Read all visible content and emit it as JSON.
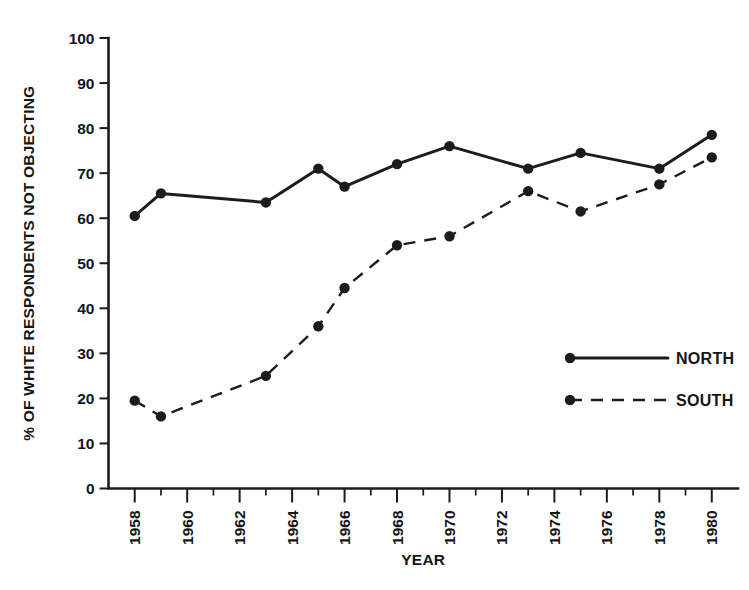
{
  "chart_data": {
    "type": "line",
    "title": "",
    "xlabel": "YEAR",
    "ylabel": "% OF WHITE RESPONDENTS NOT OBJECTING",
    "xlim": [
      1957,
      1981
    ],
    "ylim": [
      0,
      100
    ],
    "grid": false,
    "legend_position": "center-right",
    "y_ticks": [
      0,
      10,
      20,
      30,
      40,
      50,
      60,
      70,
      80,
      90,
      100
    ],
    "y_tick_labels": [
      "0",
      "10",
      "20",
      "30",
      "40",
      "50",
      "60",
      "70",
      "80",
      "90",
      "100"
    ],
    "x_ticks": [
      1958,
      1960,
      1962,
      1964,
      1966,
      1968,
      1970,
      1972,
      1974,
      1976,
      1978,
      1980
    ],
    "x_tick_labels": [
      "1958",
      "1960",
      "1962",
      "1964",
      "1966",
      "1968",
      "1970",
      "1972",
      "1974",
      "1976",
      "1978",
      "1980"
    ],
    "x_minor_ticks": [
      1959,
      1961,
      1963,
      1965,
      1967,
      1969,
      1971,
      1973,
      1975,
      1977,
      1979
    ],
    "series": [
      {
        "name": "NORTH",
        "style": "solid",
        "color": "#1c1c1c",
        "marker": "filled-circle",
        "x": [
          1958,
          1959,
          1963,
          1965,
          1966,
          1968,
          1970,
          1973,
          1975,
          1978,
          1980
        ],
        "values": [
          60.5,
          65.5,
          63.5,
          71.0,
          67.0,
          72.0,
          76.0,
          71.0,
          74.5,
          71.0,
          78.5
        ]
      },
      {
        "name": "SOUTH",
        "style": "dashed",
        "color": "#1c1c1c",
        "marker": "filled-circle",
        "x": [
          1958,
          1959,
          1963,
          1965,
          1966,
          1968,
          1970,
          1973,
          1975,
          1978,
          1980
        ],
        "values": [
          19.5,
          16.0,
          25.0,
          36.0,
          44.5,
          54.0,
          56.0,
          66.0,
          61.5,
          67.5,
          73.5
        ]
      }
    ]
  },
  "legend": {
    "entries": [
      {
        "label": "NORTH",
        "style": "solid"
      },
      {
        "label": "SOUTH",
        "style": "dashed"
      }
    ]
  }
}
